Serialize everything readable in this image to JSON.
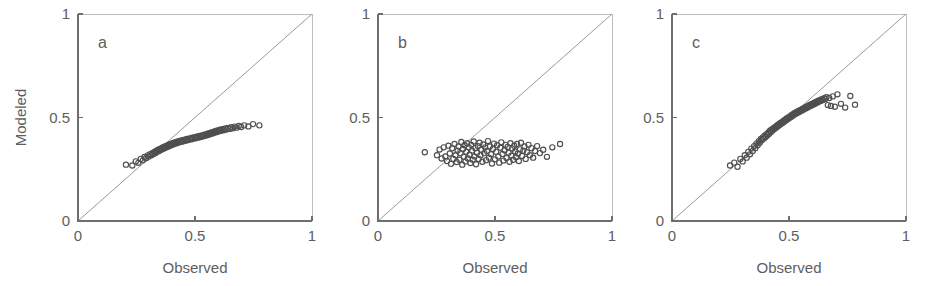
{
  "figure": {
    "background": "#ffffff",
    "marker_color": "#4f4f4f",
    "axis_color": "#6e6e6e",
    "text_color": "#5e5e5e",
    "refline_color": "#9a9a9a"
  },
  "chart_data": [
    {
      "type": "scatter",
      "panel": "a",
      "title": "a",
      "xlabel": "Observed",
      "ylabel": "Modeled",
      "xlim": [
        0,
        1
      ],
      "ylim": [
        0,
        1
      ],
      "xticks": [
        0,
        0.5,
        1
      ],
      "yticks": [
        0,
        0.5,
        1
      ],
      "xticklabels": [
        "0",
        "0.5",
        "1"
      ],
      "yticklabels": [
        "0",
        "0.5",
        "1"
      ],
      "grid": false,
      "legend": "none",
      "annotations": [
        "1:1 reference line"
      ],
      "reference_line": {
        "type": "identity",
        "from": [
          0,
          0
        ],
        "to": [
          1,
          1
        ]
      },
      "x": [
        0.205,
        0.232,
        0.247,
        0.258,
        0.268,
        0.277,
        0.284,
        0.291,
        0.298,
        0.303,
        0.309,
        0.314,
        0.319,
        0.323,
        0.327,
        0.331,
        0.334,
        0.338,
        0.341,
        0.345,
        0.348,
        0.351,
        0.354,
        0.357,
        0.36,
        0.363,
        0.366,
        0.369,
        0.372,
        0.375,
        0.378,
        0.381,
        0.384,
        0.387,
        0.39,
        0.393,
        0.396,
        0.399,
        0.403,
        0.406,
        0.41,
        0.414,
        0.418,
        0.422,
        0.426,
        0.43,
        0.435,
        0.44,
        0.445,
        0.45,
        0.455,
        0.46,
        0.466,
        0.471,
        0.477,
        0.482,
        0.488,
        0.493,
        0.499,
        0.504,
        0.51,
        0.515,
        0.52,
        0.525,
        0.53,
        0.535,
        0.54,
        0.544,
        0.549,
        0.553,
        0.557,
        0.561,
        0.565,
        0.569,
        0.573,
        0.577,
        0.581,
        0.585,
        0.589,
        0.593,
        0.597,
        0.602,
        0.607,
        0.612,
        0.617,
        0.623,
        0.629,
        0.635,
        0.641,
        0.648,
        0.655,
        0.662,
        0.67,
        0.678,
        0.687,
        0.697,
        0.71,
        0.728,
        0.748,
        0.775
      ],
      "y": [
        0.272,
        0.268,
        0.288,
        0.281,
        0.3,
        0.293,
        0.309,
        0.303,
        0.317,
        0.311,
        0.323,
        0.318,
        0.329,
        0.324,
        0.334,
        0.329,
        0.339,
        0.334,
        0.343,
        0.338,
        0.347,
        0.342,
        0.35,
        0.346,
        0.354,
        0.349,
        0.357,
        0.352,
        0.36,
        0.355,
        0.363,
        0.358,
        0.366,
        0.361,
        0.369,
        0.364,
        0.372,
        0.367,
        0.375,
        0.37,
        0.378,
        0.373,
        0.381,
        0.376,
        0.384,
        0.379,
        0.387,
        0.382,
        0.39,
        0.385,
        0.393,
        0.388,
        0.396,
        0.391,
        0.399,
        0.394,
        0.402,
        0.397,
        0.405,
        0.4,
        0.408,
        0.403,
        0.411,
        0.406,
        0.414,
        0.409,
        0.417,
        0.412,
        0.42,
        0.415,
        0.423,
        0.418,
        0.426,
        0.421,
        0.429,
        0.424,
        0.432,
        0.427,
        0.435,
        0.43,
        0.438,
        0.433,
        0.441,
        0.436,
        0.444,
        0.439,
        0.447,
        0.442,
        0.45,
        0.445,
        0.453,
        0.448,
        0.456,
        0.451,
        0.459,
        0.454,
        0.462,
        0.457,
        0.468,
        0.462
      ]
    },
    {
      "type": "scatter",
      "panel": "b",
      "title": "b",
      "xlabel": "Observed",
      "ylabel": "",
      "xlim": [
        0,
        1
      ],
      "ylim": [
        0,
        1
      ],
      "xticks": [
        0,
        0.5,
        1
      ],
      "yticks": [
        0,
        0.5,
        1
      ],
      "xticklabels": [
        "0",
        "0.5",
        "1"
      ],
      "yticklabels": [
        "0",
        "0.5",
        "1"
      ],
      "grid": false,
      "legend": "none",
      "annotations": [
        "1:1 reference line"
      ],
      "reference_line": {
        "type": "identity",
        "from": [
          0,
          0
        ],
        "to": [
          1,
          1
        ]
      },
      "x": [
        0.2,
        0.252,
        0.263,
        0.272,
        0.281,
        0.288,
        0.295,
        0.301,
        0.307,
        0.312,
        0.317,
        0.322,
        0.327,
        0.331,
        0.336,
        0.34,
        0.344,
        0.348,
        0.352,
        0.356,
        0.36,
        0.363,
        0.367,
        0.37,
        0.374,
        0.377,
        0.381,
        0.384,
        0.388,
        0.391,
        0.395,
        0.398,
        0.402,
        0.405,
        0.409,
        0.412,
        0.416,
        0.419,
        0.423,
        0.427,
        0.43,
        0.434,
        0.438,
        0.442,
        0.446,
        0.45,
        0.454,
        0.458,
        0.462,
        0.466,
        0.47,
        0.474,
        0.478,
        0.483,
        0.487,
        0.491,
        0.496,
        0.5,
        0.505,
        0.509,
        0.514,
        0.518,
        0.523,
        0.527,
        0.532,
        0.536,
        0.541,
        0.545,
        0.549,
        0.554,
        0.558,
        0.562,
        0.566,
        0.57,
        0.574,
        0.578,
        0.582,
        0.586,
        0.59,
        0.594,
        0.598,
        0.602,
        0.607,
        0.611,
        0.616,
        0.621,
        0.626,
        0.631,
        0.637,
        0.643,
        0.649,
        0.656,
        0.663,
        0.671,
        0.68,
        0.692,
        0.706,
        0.722,
        0.745,
        0.778
      ],
      "y": [
        0.332,
        0.318,
        0.345,
        0.302,
        0.356,
        0.312,
        0.29,
        0.364,
        0.326,
        0.276,
        0.352,
        0.3,
        0.372,
        0.318,
        0.285,
        0.34,
        0.36,
        0.296,
        0.328,
        0.382,
        0.272,
        0.348,
        0.31,
        0.366,
        0.288,
        0.334,
        0.376,
        0.302,
        0.356,
        0.32,
        0.28,
        0.368,
        0.34,
        0.296,
        0.384,
        0.312,
        0.352,
        0.274,
        0.33,
        0.362,
        0.3,
        0.378,
        0.318,
        0.344,
        0.286,
        0.37,
        0.328,
        0.356,
        0.294,
        0.338,
        0.386,
        0.306,
        0.36,
        0.322,
        0.278,
        0.348,
        0.374,
        0.298,
        0.334,
        0.366,
        0.312,
        0.282,
        0.354,
        0.38,
        0.324,
        0.292,
        0.342,
        0.368,
        0.304,
        0.358,
        0.33,
        0.286,
        0.376,
        0.316,
        0.35,
        0.296,
        0.364,
        0.336,
        0.308,
        0.372,
        0.326,
        0.29,
        0.346,
        0.378,
        0.314,
        0.34,
        0.36,
        0.3,
        0.332,
        0.368,
        0.318,
        0.352,
        0.306,
        0.338,
        0.362,
        0.328,
        0.344,
        0.31,
        0.356,
        0.372
      ]
    },
    {
      "type": "scatter",
      "panel": "c",
      "title": "c",
      "xlabel": "Observed",
      "ylabel": "",
      "xlim": [
        0,
        1
      ],
      "ylim": [
        0,
        1
      ],
      "xticks": [
        0,
        0.5,
        1
      ],
      "yticks": [
        0,
        0.5,
        1
      ],
      "xticklabels": [
        "0",
        "0.5",
        "1"
      ],
      "yticklabels": [
        "0",
        "0.5",
        "1"
      ],
      "grid": false,
      "legend": "none",
      "annotations": [
        "1:1 reference line"
      ],
      "reference_line": {
        "type": "identity",
        "from": [
          0,
          0
        ],
        "to": [
          1,
          1
        ]
      },
      "x": [
        0.248,
        0.266,
        0.28,
        0.292,
        0.302,
        0.311,
        0.319,
        0.326,
        0.333,
        0.339,
        0.345,
        0.351,
        0.356,
        0.361,
        0.366,
        0.371,
        0.375,
        0.38,
        0.384,
        0.388,
        0.392,
        0.396,
        0.4,
        0.404,
        0.408,
        0.412,
        0.415,
        0.419,
        0.423,
        0.426,
        0.43,
        0.434,
        0.437,
        0.441,
        0.444,
        0.448,
        0.451,
        0.455,
        0.458,
        0.462,
        0.465,
        0.469,
        0.472,
        0.476,
        0.479,
        0.483,
        0.486,
        0.49,
        0.494,
        0.497,
        0.501,
        0.505,
        0.508,
        0.512,
        0.516,
        0.52,
        0.523,
        0.527,
        0.531,
        0.535,
        0.539,
        0.543,
        0.547,
        0.551,
        0.555,
        0.559,
        0.563,
        0.567,
        0.571,
        0.575,
        0.579,
        0.583,
        0.587,
        0.591,
        0.595,
        0.599,
        0.603,
        0.607,
        0.611,
        0.615,
        0.619,
        0.623,
        0.627,
        0.631,
        0.636,
        0.64,
        0.645,
        0.65,
        0.655,
        0.66,
        0.666,
        0.672,
        0.679,
        0.687,
        0.696,
        0.707,
        0.722,
        0.74,
        0.762,
        0.782
      ],
      "y": [
        0.268,
        0.282,
        0.262,
        0.3,
        0.288,
        0.318,
        0.306,
        0.334,
        0.322,
        0.35,
        0.338,
        0.362,
        0.352,
        0.374,
        0.366,
        0.386,
        0.378,
        0.396,
        0.39,
        0.404,
        0.398,
        0.412,
        0.406,
        0.42,
        0.414,
        0.428,
        0.422,
        0.436,
        0.43,
        0.442,
        0.438,
        0.448,
        0.444,
        0.454,
        0.45,
        0.46,
        0.456,
        0.466,
        0.462,
        0.472,
        0.468,
        0.478,
        0.474,
        0.484,
        0.48,
        0.49,
        0.486,
        0.496,
        0.492,
        0.5,
        0.497,
        0.506,
        0.502,
        0.512,
        0.508,
        0.518,
        0.514,
        0.523,
        0.519,
        0.528,
        0.524,
        0.533,
        0.529,
        0.538,
        0.534,
        0.543,
        0.539,
        0.548,
        0.544,
        0.552,
        0.548,
        0.557,
        0.553,
        0.562,
        0.558,
        0.566,
        0.562,
        0.571,
        0.567,
        0.575,
        0.571,
        0.58,
        0.576,
        0.584,
        0.58,
        0.589,
        0.585,
        0.593,
        0.589,
        0.598,
        0.56,
        0.594,
        0.556,
        0.602,
        0.552,
        0.612,
        0.566,
        0.548,
        0.604,
        0.562
      ]
    }
  ]
}
